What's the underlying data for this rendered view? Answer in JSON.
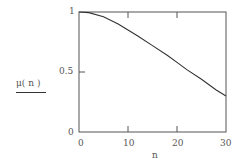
{
  "chart_data": {
    "type": "line",
    "title": "",
    "xlabel": "n",
    "ylabel": "μ(n)",
    "xlim": [
      0,
      30
    ],
    "ylim": [
      0,
      1
    ],
    "x_ticks": [
      "0",
      "10",
      "20",
      "30"
    ],
    "y_ticks": [
      "0",
      "0.5",
      "1"
    ],
    "grid": false,
    "legend": null,
    "series": [
      {
        "name": "μ(n)",
        "x": [
          0,
          2,
          5,
          8,
          10,
          12,
          15,
          18,
          20,
          22,
          25,
          28,
          30
        ],
        "values": [
          1.0,
          0.995,
          0.96,
          0.9,
          0.85,
          0.8,
          0.72,
          0.64,
          0.58,
          0.52,
          0.44,
          0.35,
          0.3
        ]
      }
    ]
  },
  "axis": {
    "y_top": "1",
    "y_mid": "0.5",
    "y_bottom": "0",
    "x_0": "0",
    "x_10": "10",
    "x_20": "20",
    "x_30": "30",
    "x_label": "n",
    "y_label": "μ( n )"
  },
  "colors": {
    "line": "#333333",
    "frame": "#555555"
  }
}
